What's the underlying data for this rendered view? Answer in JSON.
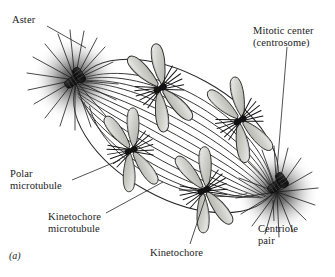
{
  "figure": {
    "panel_id": "(a)",
    "background_color": "#ffffff",
    "ink_color": "#1a1a1a",
    "chromosome_fill": "#c9c9c4",
    "aster_halo_color": "#4a4a4a"
  },
  "labels": {
    "aster": "Aster",
    "mitotic_center": "Mitotic center\n(centrosome)",
    "polar_microtubule": "Polar\nmicrotubule",
    "kinetochore_microtubule": "Kinetochore\nmicrotubule",
    "kinetochore": "Kinetochore",
    "centriole_pair": "Centriole\npair"
  },
  "structures": {
    "poles": [
      {
        "name": "left-pole",
        "x": 75,
        "y": 80
      },
      {
        "name": "right-pole",
        "x": 277,
        "y": 192
      }
    ],
    "chromosomes": [
      {
        "name": "chromosome-1",
        "x": 160,
        "y": 88,
        "rotation": -28
      },
      {
        "name": "chromosome-2",
        "x": 131,
        "y": 150,
        "rotation": -20
      },
      {
        "name": "chromosome-3",
        "x": 240,
        "y": 120,
        "rotation": -30
      },
      {
        "name": "chromosome-4",
        "x": 204,
        "y": 190,
        "rotation": -22
      }
    ],
    "spindle": {
      "center_x": 176,
      "center_y": 136,
      "rx": 112,
      "ry": 62,
      "tilt_deg": 29
    }
  }
}
